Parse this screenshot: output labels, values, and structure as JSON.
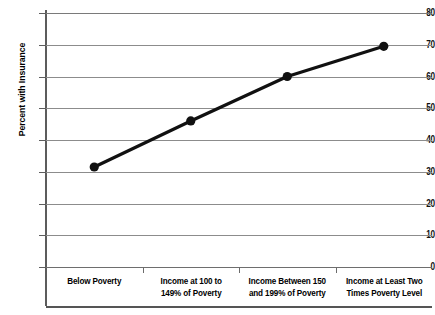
{
  "chart_data": {
    "type": "line",
    "title": "",
    "xlabel": "",
    "ylabel": "Percent with Insurance",
    "ylim": [
      0,
      80
    ],
    "ytick_step": 10,
    "yticks": [
      80,
      70,
      60,
      50,
      40,
      30,
      20,
      10,
      0
    ],
    "grid": true,
    "legend": "none",
    "categories": [
      "Below Poverty",
      "Income at 100 to 149% of Poverty",
      "Income Between 150 and 199% of Poverty",
      "Income at Least Two Times Poverty Level"
    ],
    "category_lines": [
      [
        "Below Poverty"
      ],
      [
        "Income at 100 to",
        "149% of Poverty"
      ],
      [
        "Income Between 150",
        "and 199% of Poverty"
      ],
      [
        "Income at Least Two",
        "Times Poverty Level"
      ]
    ],
    "values": [
      31.5,
      46.0,
      60.0,
      69.5
    ],
    "series": [
      {
        "name": "Percent with Insurance",
        "values": [
          31.5,
          46.0,
          60.0,
          69.5
        ]
      }
    ],
    "marker": "filled-circle",
    "colors": {
      "line": "#111111",
      "marker": "#111111",
      "grid": "#8c8c8c",
      "axis": "#5c5c5c",
      "background": "#ffffff",
      "text": "#000000"
    }
  }
}
